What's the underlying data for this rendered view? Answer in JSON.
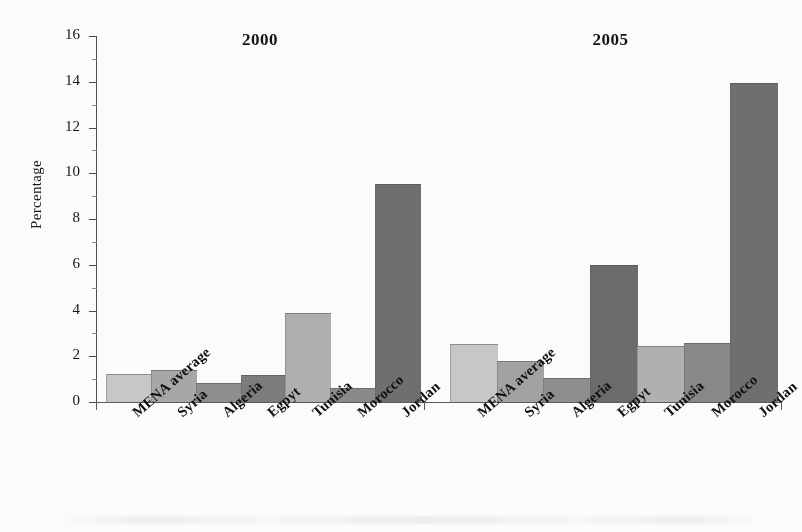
{
  "chart_data": {
    "type": "bar",
    "title": "",
    "xlabel": "",
    "ylabel": "Percentage",
    "ylim": [
      0,
      16
    ],
    "ytick_step": 2,
    "ytick_labels": [
      "0",
      "2",
      "4",
      "6",
      "8",
      "10",
      "12",
      "14",
      "16"
    ],
    "grid": false,
    "legend": "none",
    "panels": [
      {
        "title": "2000",
        "categories": [
          "MENA average",
          "Syria",
          "Algeria",
          "Egpyt",
          "Tunisia",
          "Morocco",
          "Jordan"
        ],
        "values": [
          1.2,
          1.35,
          0.8,
          1.15,
          3.85,
          0.55,
          9.5
        ],
        "bar_shades": [
          "#c9c9c9",
          "#a8a8a8",
          "#8e8e8e",
          "#7c7c7c",
          "#b0b0b0",
          "#8a8a8a",
          "#6f6f6f"
        ]
      },
      {
        "title": "2005",
        "categories": [
          "MENA average",
          "Syria",
          "Algeria",
          "Egpyt",
          "Tunisia",
          "Morocco",
          "Jordan"
        ],
        "values": [
          2.5,
          1.75,
          1.0,
          5.95,
          2.4,
          2.55,
          13.9
        ],
        "bar_shades": [
          "#c9c9c9",
          "#a3a3a3",
          "#8e8e8e",
          "#6a6a6a",
          "#b2b2b2",
          "#888888",
          "#6f6f6f"
        ]
      }
    ]
  },
  "axis": {
    "ylabel": "Percentage",
    "ticks": [
      "16",
      "14",
      "12",
      "10",
      "8",
      "6",
      "4",
      "2",
      "0"
    ]
  },
  "panel_titles": {
    "left": "2000",
    "right": "2005"
  }
}
